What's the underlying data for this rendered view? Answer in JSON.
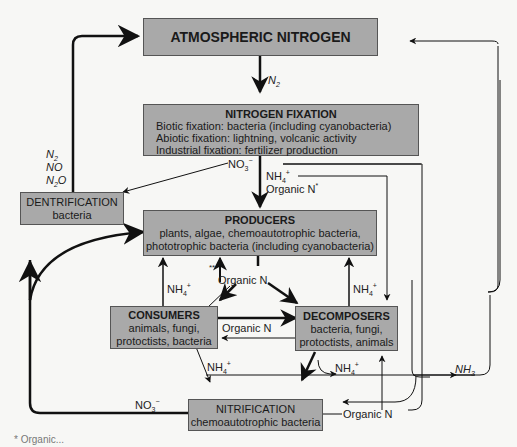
{
  "boxes": {
    "atmospheric": {
      "title": "ATMOSPHERIC NITROGEN"
    },
    "fixation": {
      "title": "NITROGEN FIXATION",
      "lines": [
        "Biotic fixation: bacteria (including cyanobacteria)",
        "Abiotic fixation: lightning, volcanic activity",
        "Industrial fixation: fertilizer production"
      ]
    },
    "denitrification": {
      "title": "DENTRIFICATION",
      "sub": "bacteria"
    },
    "producers": {
      "title": "PRODUCERS",
      "lines": [
        "plants, algae, chemoautotrophic bacteria,",
        "phototrophic bacteria (including cyanobacteria)"
      ]
    },
    "consumers": {
      "title": "CONSUMERS",
      "lines": [
        "animals, fungi,",
        "protoctists, bacteria"
      ]
    },
    "decomposers": {
      "title": "DECOMPOSERS",
      "lines": [
        "bacteria, fungi,",
        "protoctists, animals"
      ]
    },
    "nitrification": {
      "title": "NITRIFICATION",
      "sub": "chemoautotrophic bacteria"
    }
  },
  "labels": {
    "n2_main": "N",
    "n2_sub": "2",
    "denit_n2": "N",
    "denit_n2_sub": "2",
    "denit_no": "NO",
    "denit_n2o_a": "N",
    "denit_n2o_sub": "2",
    "denit_n2o_b": "O",
    "no3_top": "NO",
    "no3_top_sub": "3",
    "no3_top_sup": "−",
    "nh4_top": "NH",
    "nh4_top_sub": "4",
    "nh4_top_sup": "+",
    "organic_n_star": "Organic N",
    "organic_n_star_sup": "*",
    "double_star": "**",
    "organic_n_center": "Organic N",
    "nh4_left": "NH",
    "nh4_left_sub": "4",
    "nh4_left_sup": "+",
    "nh4_right": "NH",
    "nh4_right_sub": "4",
    "nh4_right_sup": "+",
    "organic_n_mid": "Organic N",
    "nh4_lower_left": "NH",
    "nh4_lower_left_sub": "4",
    "nh4_lower_left_sup": "+",
    "nh4_lower_right": "NH",
    "nh4_lower_right_sub": "4",
    "nh4_lower_right_sup": "+",
    "nh3": "NH",
    "nh3_sub": "3",
    "no3_bottom": "NO",
    "no3_bottom_sub": "3",
    "no3_bottom_sup": "−",
    "organic_n_bottom": "Organic N",
    "footnote": "* Organic..."
  },
  "colors": {
    "box_fill": "#a9a9a9",
    "line": "#111111",
    "background": "#f7f7f5"
  }
}
